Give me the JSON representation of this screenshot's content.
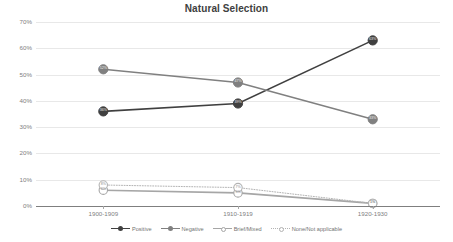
{
  "chart_data": {
    "type": "line",
    "title": "Natural Selection",
    "xlabel": "",
    "ylabel": "",
    "categories": [
      "1900-1909",
      "1910-1919",
      "1920-1930"
    ],
    "ylim": [
      0,
      70
    ],
    "ytick_labels": [
      "0%",
      "10%",
      "20%",
      "30%",
      "40%",
      "50%",
      "60%",
      "70%"
    ],
    "ytick_values": [
      0,
      10,
      20,
      30,
      40,
      50,
      60,
      70
    ],
    "grid": true,
    "legend_position": "bottom",
    "series": [
      {
        "name": "Positive",
        "color": "#404040",
        "marker": "circle-filled",
        "line_style": "solid",
        "values": [
          36,
          39,
          63
        ],
        "point_labels": [
          "36%",
          "39%",
          "63%"
        ]
      },
      {
        "name": "Negative",
        "color": "#808080",
        "marker": "circle-filled",
        "line_style": "solid",
        "values": [
          52,
          47,
          33
        ],
        "point_labels": [
          "52%",
          "47%",
          "33%"
        ]
      },
      {
        "name": "Brief/Mixed",
        "color": "#a6a6a6",
        "marker": "circle-open",
        "line_style": "solid",
        "values": [
          6,
          5,
          1
        ],
        "point_labels": [
          "6%",
          "5%",
          "1%"
        ]
      },
      {
        "name": "None/Not applicable",
        "color": "#b3b3b3",
        "marker": "circle-open",
        "line_style": "dotted",
        "values": [
          8,
          7,
          1
        ],
        "point_labels": [
          "8%",
          "7%",
          "1%"
        ]
      }
    ]
  },
  "legend": {
    "items": [
      {
        "label": "Positive"
      },
      {
        "label": "Negative"
      },
      {
        "label": "Brief/Mixed"
      },
      {
        "label": "None/Not applicable"
      }
    ]
  }
}
